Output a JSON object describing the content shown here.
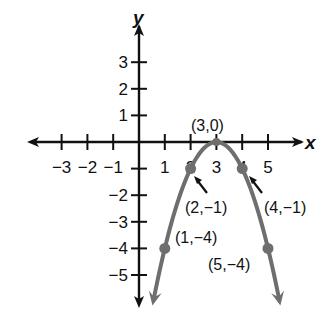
{
  "chart_data": {
    "type": "line",
    "title": "",
    "xlabel": "x",
    "ylabel": "y",
    "xlim": [
      -3.5,
      5.8
    ],
    "ylim": [
      -6,
      3.9
    ],
    "grid": false,
    "legend": null,
    "x_ticks": [
      -3,
      -2,
      -1,
      1,
      2,
      3,
      4,
      5
    ],
    "x_tick_labels": [
      "−3",
      "−2",
      "−1",
      "1",
      "2",
      "3",
      "4",
      "5"
    ],
    "y_ticks": [
      3,
      2,
      1,
      -1,
      -2,
      -3,
      -4,
      -5
    ],
    "y_tick_labels": [
      "3",
      "2",
      "1",
      "−2",
      "−3",
      "−4",
      "−5"
    ],
    "y_labeled_ticks": [
      {
        "v": 3,
        "label": "3"
      },
      {
        "v": 2,
        "label": "2"
      },
      {
        "v": 1,
        "label": "1"
      },
      {
        "v": -2,
        "label": "−2"
      },
      {
        "v": -3,
        "label": "−3"
      },
      {
        "v": -4,
        "label": "−4"
      },
      {
        "v": -5,
        "label": "−5"
      }
    ],
    "series": [
      {
        "name": "y = -(x - 3)^2",
        "color": "#6e6e6e",
        "curve": "parabola opening downward, vertex (3,0), arrows at both ends",
        "points": [
          {
            "x": 1,
            "y": -4,
            "label": "(1,−4)"
          },
          {
            "x": 2,
            "y": -1,
            "label": "(2,−1)"
          },
          {
            "x": 3,
            "y": 0,
            "label": "(3,0)"
          },
          {
            "x": 4,
            "y": -1,
            "label": "(4,−1)"
          },
          {
            "x": 5,
            "y": -4,
            "label": "(5,−4)"
          }
        ]
      }
    ],
    "annotations": [
      {
        "text": "(3,0)",
        "at": [
          3,
          0
        ],
        "position": "above"
      },
      {
        "text": "(2,−1)",
        "at": [
          2,
          -1
        ],
        "arrow": true,
        "position": "below-right"
      },
      {
        "text": "(4,−1)",
        "at": [
          4,
          -1
        ],
        "arrow": true,
        "position": "below-right"
      },
      {
        "text": "(1,−4)",
        "at": [
          1,
          -4
        ],
        "position": "upper-right"
      },
      {
        "text": "(5,−4)",
        "at": [
          5,
          -4
        ],
        "position": "lower-left"
      }
    ]
  },
  "axes": {
    "x_name": "x",
    "y_name": "y",
    "axis_color": "#111111",
    "curve_color": "#6e6e6e"
  }
}
